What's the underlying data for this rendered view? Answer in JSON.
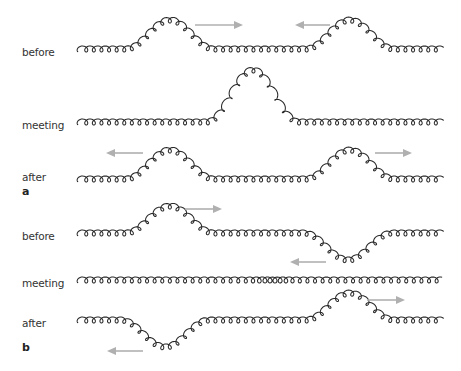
{
  "figure": {
    "panels": [
      {
        "id": "a",
        "label": "a",
        "label_y": 186,
        "rows": [
          {
            "label": "before",
            "baseline_y": 52,
            "label_y": 47,
            "pulses": [
              {
                "center_x": 170,
                "half_width": 44,
                "amplitude": -29
              },
              {
                "center_x": 350,
                "half_width": 44,
                "amplitude": -29
              }
            ],
            "arrows": [
              {
                "direction": "right",
                "x1": 195,
                "x2": 243,
                "y": 25
              },
              {
                "direction": "left",
                "x1": 330,
                "x2": 295,
                "y": 25
              }
            ]
          },
          {
            "label": "meeting",
            "baseline_y": 125,
            "label_y": 120,
            "pulses": [
              {
                "center_x": 253,
                "half_width": 46,
                "amplitude": -52
              }
            ],
            "arrows": []
          },
          {
            "label": "after",
            "baseline_y": 182,
            "label_y": 172,
            "pulses": [
              {
                "center_x": 170,
                "half_width": 44,
                "amplitude": -29
              },
              {
                "center_x": 350,
                "half_width": 44,
                "amplitude": -29
              }
            ],
            "arrows": [
              {
                "direction": "left",
                "x1": 143,
                "x2": 106,
                "y": 153
              },
              {
                "direction": "right",
                "x1": 375,
                "x2": 412,
                "y": 153
              }
            ]
          }
        ]
      },
      {
        "id": "b",
        "label": "b",
        "label_y": 342,
        "rows": [
          {
            "label": "before",
            "baseline_y": 236,
            "label_y": 231,
            "pulses": [
              {
                "center_x": 170,
                "half_width": 44,
                "amplitude": -27
              },
              {
                "center_x": 348,
                "half_width": 44,
                "amplitude": 27
              }
            ],
            "arrows": [
              {
                "direction": "right",
                "x1": 185,
                "x2": 222,
                "y": 209
              },
              {
                "direction": "left",
                "x1": 326,
                "x2": 290,
                "y": 262
              }
            ]
          },
          {
            "label": "meeting",
            "baseline_y": 283,
            "label_y": 278,
            "pulses": [],
            "arrows": []
          },
          {
            "label": "after",
            "baseline_y": 323,
            "label_y": 323,
            "pulses": [
              {
                "center_x": 165,
                "half_width": 44,
                "amplitude": 27
              },
              {
                "center_x": 350,
                "half_width": 44,
                "amplitude": -27
              }
            ],
            "arrows": [
              {
                "direction": "left",
                "x1": 143,
                "x2": 107,
                "y": 351
              },
              {
                "direction": "right",
                "x1": 367,
                "x2": 405,
                "y": 300
              }
            ]
          }
        ]
      }
    ],
    "spring": {
      "x_start": 79,
      "x_end": 441,
      "coil_pitch": 7.6,
      "coil_radius_x": 3.2,
      "coil_radius_y": 6,
      "stroke_color": "#2a2a2a",
      "arrow_color": "#b0b0b0"
    }
  }
}
